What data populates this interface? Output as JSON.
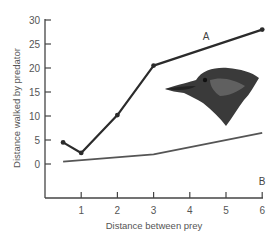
{
  "chart_data": {
    "type": "line",
    "title": "",
    "xlabel": "Distance between prey",
    "ylabel": "Distance walked by predator",
    "xlim": [
      0,
      6
    ],
    "ylim": [
      -5,
      30
    ],
    "x_ticks": [
      "1",
      "2",
      "3",
      "4",
      "5",
      "6"
    ],
    "y_ticks": [
      "0",
      "5",
      "10",
      "15",
      "20",
      "25",
      "30"
    ],
    "grid": false,
    "legend": "inline labels",
    "series": [
      {
        "name": "A",
        "x": [
          0.5,
          1,
          2,
          3,
          6
        ],
        "values": [
          4.5,
          2.3,
          10.2,
          20.5,
          28
        ],
        "color": "#2b2b2b",
        "markers": true
      },
      {
        "name": "B",
        "x": [
          0.5,
          3,
          6
        ],
        "values": [
          0.5,
          2,
          6.5
        ],
        "color": "#555555",
        "markers": false
      }
    ],
    "annotations": [
      "Illustration of a bird head (predator)"
    ]
  }
}
